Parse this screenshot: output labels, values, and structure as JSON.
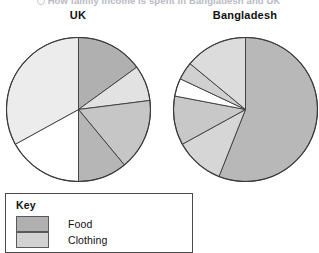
{
  "header": {
    "cutoff_text": "How family income is spent in Bangladesh and UK"
  },
  "charts": [
    {
      "id": "uk",
      "title": "UK"
    },
    {
      "id": "bd",
      "title": "Bangladesh"
    }
  ],
  "key": {
    "title": "Key",
    "items": [
      {
        "label": "Food",
        "color": "#b0b0b0"
      },
      {
        "label": "Clothing",
        "color": "#d2d2d2"
      }
    ]
  },
  "colors": {
    "outline": "#3a3a3a",
    "food": "#b0b0b0",
    "clothing": "#d2d2d2",
    "light": "#e6e6e6",
    "white": "#ffffff",
    "page_bg": "#ffffff"
  },
  "chart_data": [
    {
      "type": "pie",
      "title": "UK",
      "labels": [
        "Food",
        "Clothing",
        "Housing",
        "Fuel",
        "Transport",
        "Other"
      ],
      "values": [
        15,
        8,
        16,
        11,
        17,
        33
      ],
      "colors": [
        "#b0b0b0",
        "#e2e2e2",
        "#c6c6c6",
        "#b6b6b6",
        "#ffffff",
        "#ececec"
      ],
      "start_angle_deg": 0,
      "direction": "clockwise",
      "legend": "bottom",
      "xlabel": "",
      "ylabel": ""
    },
    {
      "type": "pie",
      "title": "Bangladesh",
      "labels": [
        "Food",
        "Clothing",
        "Housing",
        "Fuel",
        "Transport",
        "Other"
      ],
      "values": [
        56,
        11,
        11,
        4,
        4,
        14
      ],
      "colors": [
        "#b8b8b8",
        "#d6d6d6",
        "#c8c8c8",
        "#ffffff",
        "#d0d0d0",
        "#dcdcdc"
      ],
      "start_angle_deg": 0,
      "direction": "clockwise",
      "legend": "bottom",
      "xlabel": "",
      "ylabel": ""
    }
  ]
}
